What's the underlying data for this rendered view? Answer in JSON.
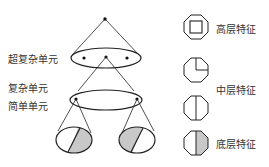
{
  "hierarchy": {
    "labels": {
      "super_complex": "超复杂单元",
      "complex": "复杂单元",
      "simple": "简单单元"
    }
  },
  "legend": {
    "items": [
      {
        "icon": "octagon-square-icon",
        "label": "高层特征"
      },
      {
        "icon": "octagon-quarter-icon",
        "label": ""
      },
      {
        "icon": "octagon-half-line-icon",
        "label": "中层特征"
      },
      {
        "icon": "octagon-half-shaded-icon",
        "label": "底层特征"
      }
    ],
    "mid_label": "中层特征"
  },
  "colors": {
    "stroke": "#222222",
    "shade": "#c8c8c8",
    "text": "#333333"
  }
}
